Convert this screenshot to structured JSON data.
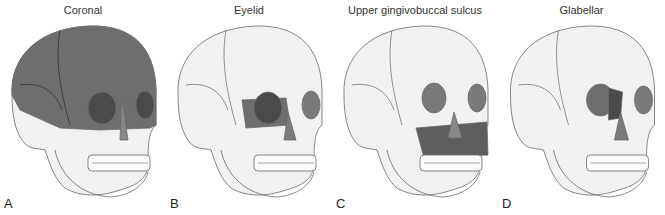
{
  "figure": {
    "panels": [
      {
        "letter": "A",
        "title": "Coronal",
        "highlight": "coronal"
      },
      {
        "letter": "B",
        "title": "Eyelid",
        "highlight": "eyelid"
      },
      {
        "letter": "C",
        "title": "Upper gingivobuccal sulcus",
        "highlight": "gingivobuccal"
      },
      {
        "letter": "D",
        "title": "Glabellar",
        "highlight": "glabellar"
      }
    ],
    "colors": {
      "bone": "#f1f1f1",
      "outline": "#777777",
      "highlight": "#6e6e6e",
      "orbit": "#4a4a4a"
    }
  }
}
